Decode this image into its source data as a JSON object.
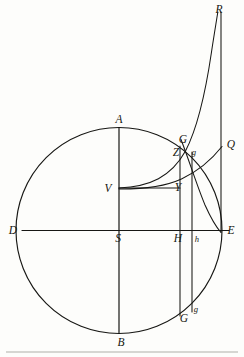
{
  "figure": {
    "canvas": {
      "width": 244,
      "height": 357
    },
    "ink_color": "#171714",
    "paper_color": "#fdfdfb",
    "rule_color": "#8e8e88"
  },
  "circle": {
    "name": "main-circle",
    "center_x": 119,
    "center_y": 230.5,
    "radius": 103
  },
  "axes": {
    "horizontal": {
      "name": "diameter-DE",
      "x1": 22,
      "y1": 230.5,
      "x2": 229,
      "y2": 230.5
    },
    "vertical": {
      "name": "diameter-AB",
      "x1": 119,
      "y1": 128,
      "x2": 119,
      "y2": 333
    }
  },
  "verticals": [
    {
      "name": "ordinate-H",
      "x": 180,
      "y_top": 146,
      "y_bottom": 316
    },
    {
      "name": "ordinate-h",
      "x": 192,
      "y_top": 152,
      "y_bottom": 312
    },
    {
      "name": "ordinate-E",
      "x": 221,
      "y_top": 12,
      "y_bottom": 232
    }
  ],
  "segments": [
    {
      "name": "segment-VH",
      "x1": 119,
      "y1": 188,
      "x2": 180,
      "y2": 188
    }
  ],
  "curves": {
    "curve_VZR": {
      "name": "curve-V-Z-R",
      "path": "M 119 188 C 150 186 172 176 186 150 C 198 126 207 84 212 50 C 215 31 217 19 218 12"
    },
    "curve_VYQ": {
      "name": "curve-V-Y-Q",
      "path": "M 119 189 C 146 189 166 186 182 178 C 199 170 213 158 222 146"
    },
    "curve_GQ_drop": {
      "name": "curve-G-E-drop",
      "path": "M 182 140 C 190 160 198 186 206 205 C 212 219 217 227 221 232"
    }
  },
  "labels": [
    {
      "id": "label-R",
      "text": "R",
      "x": 219,
      "y": 13,
      "size": "normal"
    },
    {
      "id": "label-A",
      "text": "A",
      "x": 119,
      "y": 123,
      "size": "normal"
    },
    {
      "id": "label-G-upper",
      "text": "G",
      "x": 183,
      "y": 143,
      "size": "normal"
    },
    {
      "id": "label-Q",
      "text": "Q",
      "x": 231,
      "y": 148,
      "size": "normal"
    },
    {
      "id": "label-Z",
      "text": "Z",
      "x": 176,
      "y": 156,
      "size": "normal"
    },
    {
      "id": "label-g-upper",
      "text": "g",
      "x": 194,
      "y": 155,
      "size": "small"
    },
    {
      "id": "label-V",
      "text": "V",
      "x": 108,
      "y": 192,
      "size": "normal"
    },
    {
      "id": "label-Y",
      "text": "Y",
      "x": 178,
      "y": 191,
      "size": "normal"
    },
    {
      "id": "label-D",
      "text": "D",
      "x": 13,
      "y": 234,
      "size": "normal"
    },
    {
      "id": "label-E",
      "text": "E",
      "x": 231,
      "y": 234,
      "size": "normal"
    },
    {
      "id": "label-S",
      "text": "S",
      "x": 118,
      "y": 242,
      "size": "normal"
    },
    {
      "id": "label-H",
      "text": "H",
      "x": 178,
      "y": 242,
      "size": "normal"
    },
    {
      "id": "label-h",
      "text": "h",
      "x": 197,
      "y": 242,
      "size": "small"
    },
    {
      "id": "label-g-lower",
      "text": "g",
      "x": 196,
      "y": 312,
      "size": "small"
    },
    {
      "id": "label-G-lower",
      "text": "G",
      "x": 184,
      "y": 322,
      "size": "normal"
    },
    {
      "id": "label-B",
      "text": "B",
      "x": 121,
      "y": 346,
      "size": "normal"
    }
  ],
  "footer_rule": {
    "name": "page-rule",
    "x1": 6,
    "y1": 352,
    "x2": 238,
    "y2": 352
  }
}
